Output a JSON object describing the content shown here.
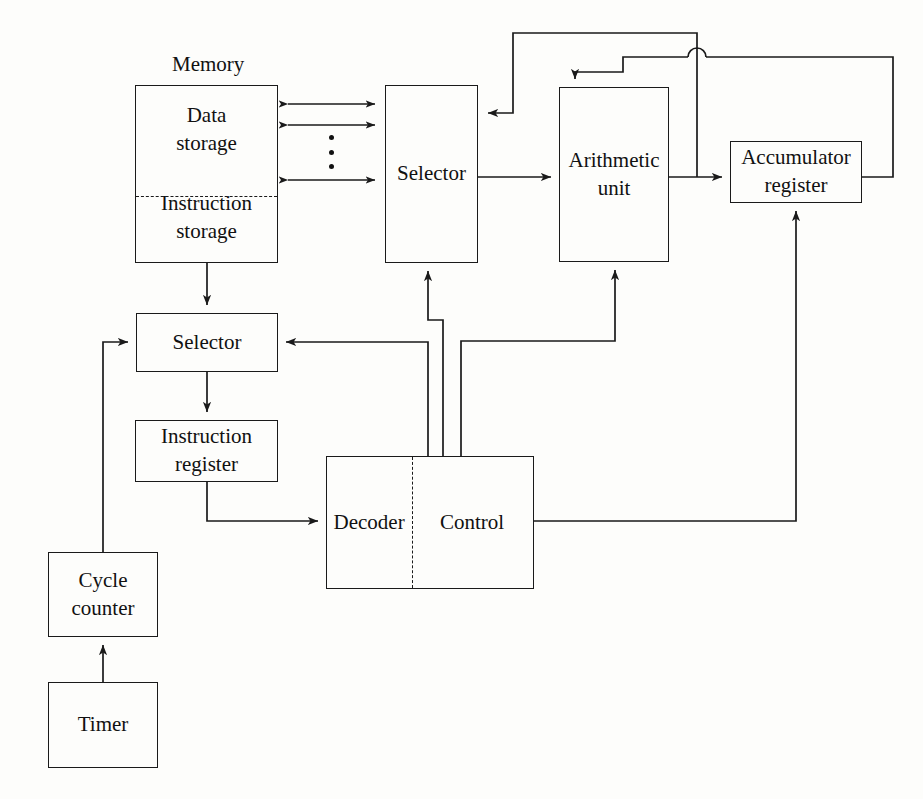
{
  "diagram": {
    "line_color": "#1a1a1a",
    "text_color": "#111111",
    "background": "#fdfdfb"
  },
  "labels": {
    "memory_caption": "Memory",
    "data_storage": [
      "Data",
      "storage"
    ],
    "instruction_storage": [
      "Instruction",
      "storage"
    ],
    "selector_top": "Selector",
    "arithmetic_unit": [
      "Arithmetic",
      "unit"
    ],
    "accumulator_register": [
      "Accumulator",
      "register"
    ],
    "selector_bottom": "Selector",
    "instruction_register": [
      "Instruction",
      "register"
    ],
    "decoder": "Decoder",
    "control": "Control",
    "cycle_counter": [
      "Cycle",
      "counter"
    ],
    "timer": "Timer"
  },
  "blocks": [
    {
      "name": "memory",
      "label": "Memory",
      "x": 135,
      "y": 85,
      "w": 143,
      "h": 178
    },
    {
      "name": "selector-top",
      "label": "Selector",
      "x": 385,
      "y": 85,
      "w": 93,
      "h": 178
    },
    {
      "name": "arithmetic-unit",
      "label": "Arithmetic unit",
      "x": 559,
      "y": 87,
      "w": 110,
      "h": 175
    },
    {
      "name": "accumulator-register",
      "label": "Accumulator register",
      "x": 730,
      "y": 141,
      "w": 132,
      "h": 62
    },
    {
      "name": "selector-bottom",
      "label": "Selector",
      "x": 136,
      "y": 313,
      "w": 142,
      "h": 59
    },
    {
      "name": "instruction-register",
      "label": "Instruction register",
      "x": 135,
      "y": 420,
      "w": 143,
      "h": 62
    },
    {
      "name": "decoder-control",
      "label": "Decoder / Control",
      "x": 326,
      "y": 456,
      "w": 208,
      "h": 133
    },
    {
      "name": "cycle-counter",
      "label": "Cycle counter",
      "x": 48,
      "y": 552,
      "w": 110,
      "h": 85
    },
    {
      "name": "timer",
      "label": "Timer",
      "x": 48,
      "y": 682,
      "w": 110,
      "h": 86
    }
  ],
  "connections": [
    {
      "name": "memory-selector-bus-1",
      "from": "memory",
      "to": "selector-top",
      "style": "double-arrow"
    },
    {
      "name": "memory-selector-bus-2",
      "from": "memory",
      "to": "selector-top",
      "style": "double-arrow"
    },
    {
      "name": "memory-selector-bus-n",
      "from": "memory",
      "to": "selector-top",
      "style": "double-arrow"
    },
    {
      "name": "selector-to-arithmetic",
      "from": "selector-top",
      "to": "arithmetic-unit",
      "style": "arrow"
    },
    {
      "name": "arithmetic-to-accumulator",
      "from": "arithmetic-unit",
      "to": "accumulator-register",
      "style": "arrow"
    },
    {
      "name": "accumulator-to-arithmetic-feedback",
      "from": "accumulator-register",
      "to": "arithmetic-unit",
      "style": "arrow"
    },
    {
      "name": "accumulator-to-selector-feedback",
      "from": "accumulator-register",
      "to": "selector-top",
      "style": "arrow"
    },
    {
      "name": "memory-to-selector-bottom",
      "from": "memory",
      "to": "selector-bottom",
      "style": "arrow"
    },
    {
      "name": "selector-to-instruction-register",
      "from": "selector-bottom",
      "to": "instruction-register",
      "style": "arrow"
    },
    {
      "name": "instruction-register-to-decoder",
      "from": "instruction-register",
      "to": "decoder-control",
      "style": "arrow"
    },
    {
      "name": "control-to-selector-bottom",
      "from": "decoder-control",
      "to": "selector-bottom",
      "style": "arrow"
    },
    {
      "name": "control-to-selector-top",
      "from": "decoder-control",
      "to": "selector-top",
      "style": "arrow"
    },
    {
      "name": "control-to-arithmetic",
      "from": "decoder-control",
      "to": "arithmetic-unit",
      "style": "arrow"
    },
    {
      "name": "control-to-accumulator",
      "from": "decoder-control",
      "to": "accumulator-register",
      "style": "arrow"
    },
    {
      "name": "cycle-counter-to-selector",
      "from": "cycle-counter",
      "to": "selector-bottom",
      "style": "arrow"
    },
    {
      "name": "timer-to-cycle-counter",
      "from": "timer",
      "to": "cycle-counter",
      "style": "arrow"
    }
  ],
  "ellipsis": {
    "name": "bus-ellipsis",
    "dots": 3,
    "x": 330,
    "y": 137
  }
}
